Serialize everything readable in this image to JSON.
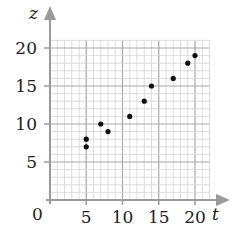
{
  "chart_data": {
    "type": "scatter",
    "title": "",
    "xlabel": "t",
    "ylabel": "z",
    "xlim": [
      0,
      22
    ],
    "ylim": [
      0,
      21
    ],
    "x_ticks": [
      5,
      10,
      15,
      20
    ],
    "y_ticks": [
      5,
      10,
      15,
      20
    ],
    "origin_label": "0",
    "grid": {
      "minor_step": 1,
      "major_step": 5,
      "on": true
    },
    "legend": null,
    "points": [
      {
        "t": 5,
        "z": 7
      },
      {
        "t": 5,
        "z": 8
      },
      {
        "t": 7,
        "z": 10
      },
      {
        "t": 8,
        "z": 9
      },
      {
        "t": 11,
        "z": 11
      },
      {
        "t": 13,
        "z": 13
      },
      {
        "t": 14,
        "z": 15
      },
      {
        "t": 17,
        "z": 16
      },
      {
        "t": 19,
        "z": 18
      },
      {
        "t": 20,
        "z": 19
      }
    ],
    "colors": {
      "points": "#111111",
      "axes": "#9a9a9a",
      "grid_minor": "#d4d4d4",
      "grid_major": "#a8a8a8"
    }
  }
}
